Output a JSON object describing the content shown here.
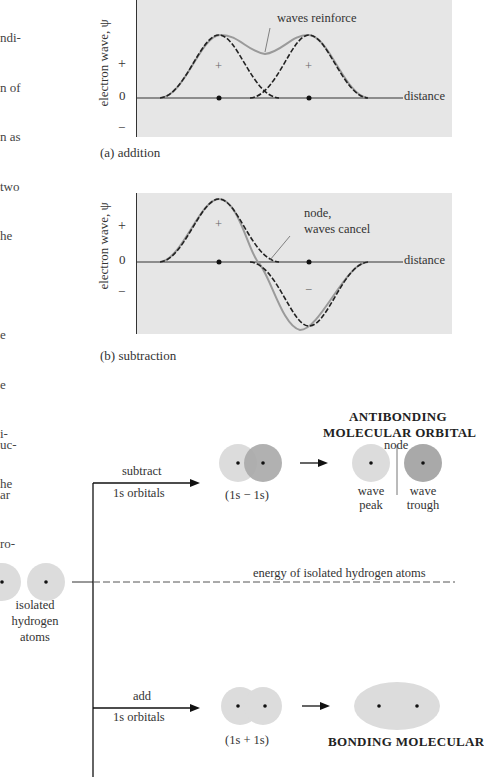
{
  "margin_text": {
    "top_lines": [
      "ndi-",
      "n of",
      "n as",
      "two",
      "he",
      "",
      "e",
      "e",
      "i-",
      "he",
      "",
      "n"
    ],
    "middle_lines": [
      "uc-",
      "ar",
      "ro-"
    ]
  },
  "figure_a": {
    "caption": "(a)  addition",
    "ylabel": "electron wave, ψ",
    "y_ticks": [
      "+",
      "0",
      "−"
    ],
    "x_axis_label": "distance",
    "annotation": "waves reinforce",
    "region_signs": [
      "+",
      "+"
    ]
  },
  "figure_b": {
    "caption": "(b)  subtraction",
    "ylabel": "electron wave, ψ",
    "y_ticks": [
      "+",
      "0",
      "−"
    ],
    "x_axis_label": "distance",
    "annotation_line1": "node,",
    "annotation_line2": "waves cancel",
    "region_signs": [
      "+",
      "−"
    ]
  },
  "orbital_diagram": {
    "isolated_label": [
      "isolated",
      "hydrogen",
      "atoms"
    ],
    "subtract_label": "subtract",
    "subtract_sub": "1s orbitals",
    "add_label": "add",
    "add_sub": "1s orbitals",
    "minus_combo": "(1s − 1s)",
    "plus_combo": "(1s + 1s)",
    "energy_label": "energy of isolated hydrogen atoms",
    "antibonding_title_1": "ANTIBONDING",
    "antibonding_title_2": "MOLECULAR ORBITAL",
    "node_label": "node",
    "peak_label": [
      "wave",
      "peak"
    ],
    "trough_label": [
      "wave",
      "trough"
    ],
    "bonding_title": "BONDING  MOLECULAR"
  },
  "colors": {
    "panel_bg": "#e6e6e6",
    "light_orbital": "#dcdcdc",
    "dark_orbital": "#a9a9a9",
    "sum_curve": "#999999"
  }
}
